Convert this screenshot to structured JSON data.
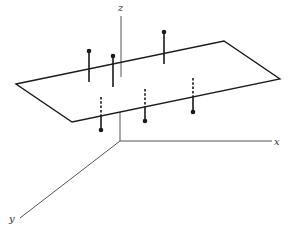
{
  "diagram": {
    "colors": {
      "ink": "#1a1a1a",
      "axis": "#555555",
      "background": "#ffffff"
    },
    "axes": {
      "origin": [
        120,
        141
      ],
      "x": {
        "label": "x",
        "end": [
          272,
          141
        ],
        "label_pos": [
          274,
          145
        ]
      },
      "y": {
        "label": "y",
        "end": [
          20,
          218
        ],
        "label_pos": [
          9,
          222
        ]
      },
      "z": {
        "label": "z",
        "top": [
          121,
          16
        ],
        "plane_front": [
          120,
          112
        ],
        "label_pos": [
          118,
          11
        ]
      }
    },
    "plane": {
      "corners": [
        [
          16,
          84
        ],
        [
          224,
          41
        ],
        [
          280,
          79
        ],
        [
          72,
          122
        ]
      ]
    },
    "points_above": [
      {
        "id": "p1",
        "dot": [
          89,
          51
        ],
        "stem_end": [
          89,
          82
        ]
      },
      {
        "id": "p2",
        "dot": [
          113,
          56
        ],
        "stem_end": [
          113,
          87
        ]
      },
      {
        "id": "p3",
        "dot": [
          164,
          32
        ],
        "stem_end": [
          164,
          64
        ]
      }
    ],
    "points_below": [
      {
        "id": "p4",
        "dash_top": [
          101,
          97
        ],
        "plane_cross": [
          101,
          115
        ],
        "dot": [
          101,
          130
        ]
      },
      {
        "id": "p5",
        "dash_top": [
          145,
          89
        ],
        "plane_cross": [
          145,
          107
        ],
        "dot": [
          145,
          121
        ]
      },
      {
        "id": "p6",
        "dash_top": [
          193,
          78
        ],
        "plane_cross": [
          193,
          96
        ],
        "dot": [
          193,
          112
        ]
      }
    ]
  }
}
